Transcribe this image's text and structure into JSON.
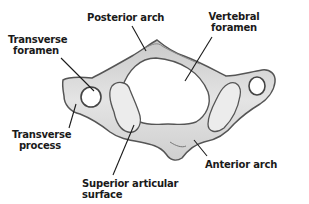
{
  "diagram": {
    "labels": {
      "posterior_arch": "Posterior arch",
      "vertebral_foramen_line1": "Vertebral",
      "vertebral_foramen_line2": "foramen",
      "transverse_foramen_line1": "Transverse",
      "transverse_foramen_line2": "foramen",
      "transverse_process_line1": "Transverse",
      "transverse_process_line2": "process",
      "superior_articular_line1": "Superior articular",
      "superior_articular_line2": "surface",
      "anterior_arch": "Anterior arch"
    },
    "colors": {
      "bone_fill": "#d9d9d9",
      "bone_outline": "#555555",
      "foramen_fill": "#ffffff",
      "articular_fill": "#ececec",
      "leader_line": "#1a1a1a",
      "text": "#1a1a1a"
    }
  }
}
